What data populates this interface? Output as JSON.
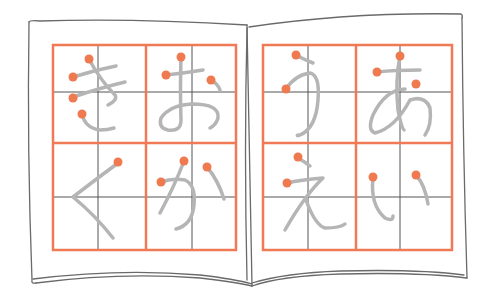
{
  "illustration": {
    "subject": "open hiragana practice notebook",
    "colors": {
      "grid": "#ef7a55",
      "guide": "#555555",
      "stroke": "#b5b5b5",
      "start_dot": "#f07a50",
      "outline": "#6a6a6a",
      "background": "#ffffff"
    },
    "left_page": {
      "characters": [
        "き",
        "お",
        "く",
        "か"
      ]
    },
    "right_page": {
      "characters": [
        "う",
        "あ",
        "え",
        "い"
      ]
    }
  }
}
